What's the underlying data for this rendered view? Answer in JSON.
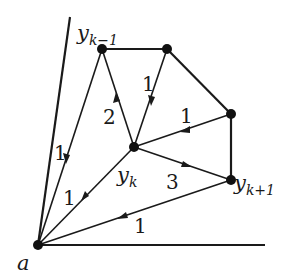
{
  "diagram": {
    "type": "directed-weighted-graph",
    "nodes": [
      {
        "id": "a",
        "label": "a",
        "x": 38,
        "y": 245
      },
      {
        "id": "ykm1",
        "label": "y",
        "sub": "k−1",
        "x": 102,
        "y": 49
      },
      {
        "id": "top",
        "label": "",
        "x": 167,
        "y": 49
      },
      {
        "id": "right",
        "label": "",
        "x": 231,
        "y": 114
      },
      {
        "id": "yk",
        "label": "y",
        "sub": "k",
        "x": 134,
        "y": 147
      },
      {
        "id": "ykp1",
        "label": "y",
        "sub": "k+1",
        "x": 231,
        "y": 180
      }
    ],
    "edges": [
      {
        "from": "ykm1",
        "to": "a",
        "weight": "1",
        "directed": true
      },
      {
        "from": "yk",
        "to": "ykm1",
        "weight": "2",
        "directed": true
      },
      {
        "from": "top",
        "to": "yk",
        "weight": "1",
        "directed": true
      },
      {
        "from": "right",
        "to": "yk",
        "weight": "1",
        "directed": true
      },
      {
        "from": "yk",
        "to": "ykp1",
        "weight": "3",
        "directed": true
      },
      {
        "from": "yk",
        "to": "a",
        "weight": "1",
        "directed": true
      },
      {
        "from": "ykp1",
        "to": "a",
        "weight": "1",
        "directed": true
      },
      {
        "from": "ykm1",
        "to": "top",
        "weight": "",
        "directed": false
      },
      {
        "from": "top",
        "to": "right",
        "weight": "",
        "directed": false
      },
      {
        "from": "right",
        "to": "ykp1",
        "weight": "",
        "directed": false
      }
    ],
    "axes": [
      {
        "name": "left-ray",
        "from": [
          38,
          245
        ],
        "to": [
          70,
          17
        ]
      },
      {
        "name": "bottom-ray",
        "from": [
          38,
          245
        ],
        "to": [
          265,
          245
        ]
      }
    ]
  },
  "labels": {
    "a": "a",
    "ykm1_base": "y",
    "ykm1_sub": "k−1",
    "yk_base": "y",
    "yk_sub": "k",
    "ykp1_base": "y",
    "ykp1_sub": "k+1",
    "w_ykm1_a": "1",
    "w_yk_ykm1": "2",
    "w_top_yk": "1",
    "w_right_yk": "1",
    "w_yk_ykp1": "3",
    "w_yk_a": "1",
    "w_ykp1_a": "1"
  }
}
